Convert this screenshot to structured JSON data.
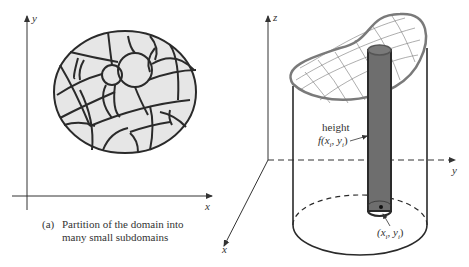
{
  "panel_a": {
    "axis_y_label": "y",
    "axis_x_label": "x",
    "caption_tag": "(a)",
    "caption_line1": "Partition of the domain into",
    "caption_line2": "many small subdomains"
  },
  "panel_b": {
    "axis_z_label": "z",
    "axis_y_label": "y",
    "axis_x_label": "x",
    "height_label": "height",
    "height_func": "f(x",
    "height_func_sub_i": "i",
    "height_func_mid": ", y",
    "height_func_sub_i2": "i",
    "height_func_close": ")",
    "point_open": "(x",
    "point_sub_i": "i",
    "point_mid": ", y",
    "point_sub_i2": "i",
    "point_close": ")"
  },
  "colors": {
    "domain_fill": "#e6e6e6",
    "outline": "#2a2a2a",
    "column_fill": "#6e6e6e",
    "surface_edge": "#7a7a7a"
  }
}
